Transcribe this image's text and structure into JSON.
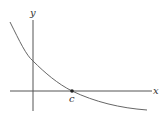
{
  "figure": {
    "type": "function-graph",
    "axes": {
      "x_label": "x",
      "y_label": "y"
    },
    "point": {
      "label": "c",
      "on": "x-axis"
    },
    "colors": {
      "axis": "#555555",
      "curve": "#666666",
      "point": "#222222",
      "text": "#333333"
    }
  }
}
